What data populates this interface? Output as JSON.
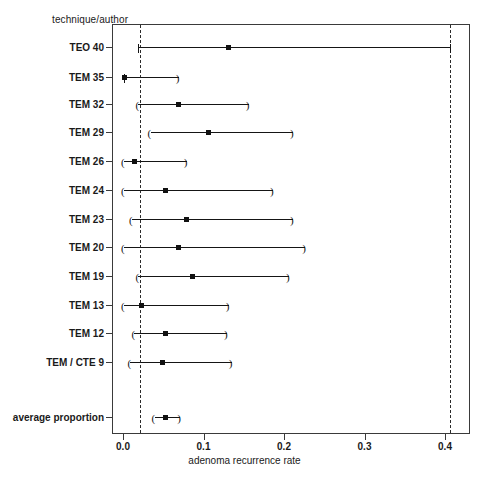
{
  "chart_data": {
    "type": "scatter",
    "title": "",
    "subtitle": "",
    "xlabel": "adenoma recurrence rate",
    "ylabel": "technique/author",
    "xlim": [
      -0.0137,
      0.431
    ],
    "xticks": [
      0.0,
      0.1,
      0.2,
      0.3,
      0.4
    ],
    "xticklabels": [
      "0.0",
      "0.1",
      "0.2",
      "0.3",
      "0.4"
    ],
    "grid": false,
    "legend": null,
    "orientation": "horizontal-forest-plot",
    "reference_lines": [
      {
        "name": "lower-reference",
        "x": 0.02,
        "style": "dashed"
      },
      {
        "name": "upper-reference",
        "x": 0.405,
        "style": "dashed"
      }
    ],
    "categories": [
      "TEO 40",
      "TEM 35",
      "TEM 32",
      "TEM 29",
      "TEM 26",
      "TEM 24",
      "TEM 23",
      "TEM 20",
      "TEM 19",
      "TEM 13",
      "TEM 12",
      "TEM / CTE 9",
      "average proportion"
    ],
    "series": [
      {
        "name": "adenoma recurrence rate (proportion with 95% CI)",
        "points": [
          {
            "label": "TEO 40",
            "estimate": 0.13,
            "ci_low": 0.018,
            "ci_high": 0.405,
            "y_px": 47,
            "cap_low": "|",
            "cap_high": "|"
          },
          {
            "label": "TEM 35",
            "estimate": 0.001,
            "ci_low": 0.0,
            "ci_high": 0.068,
            "y_px": 77,
            "cap_low": "|",
            "cap_high": ")"
          },
          {
            "label": "TEM 32",
            "estimate": 0.068,
            "ci_low": 0.018,
            "ci_high": 0.155,
            "y_px": 104,
            "cap_low": "(",
            "cap_high": ")"
          },
          {
            "label": "TEM 29",
            "estimate": 0.105,
            "ci_low": 0.033,
            "ci_high": 0.21,
            "y_px": 132,
            "cap_low": "(",
            "cap_high": ")"
          },
          {
            "label": "TEM 26",
            "estimate": 0.013,
            "ci_low": 0.0,
            "ci_high": 0.078,
            "y_px": 161,
            "cap_low": "(",
            "cap_high": ")"
          },
          {
            "label": "TEM 24",
            "estimate": 0.052,
            "ci_low": 0.0,
            "ci_high": 0.185,
            "y_px": 190,
            "cap_low": "(",
            "cap_high": ")"
          },
          {
            "label": "TEM 23",
            "estimate": 0.078,
            "ci_low": 0.01,
            "ci_high": 0.21,
            "y_px": 219,
            "cap_low": "(",
            "cap_high": ")"
          },
          {
            "label": "TEM 20",
            "estimate": 0.068,
            "ci_low": 0.0,
            "ci_high": 0.225,
            "y_px": 247,
            "cap_low": "(",
            "cap_high": ")"
          },
          {
            "label": "TEM 19",
            "estimate": 0.085,
            "ci_low": 0.018,
            "ci_high": 0.205,
            "y_px": 276,
            "cap_low": "(",
            "cap_high": ")"
          },
          {
            "label": "TEM 13",
            "estimate": 0.022,
            "ci_low": 0.0,
            "ci_high": 0.13,
            "y_px": 305,
            "cap_low": "(",
            "cap_high": ")"
          },
          {
            "label": "TEM 12",
            "estimate": 0.051,
            "ci_low": 0.013,
            "ci_high": 0.128,
            "y_px": 333,
            "cap_low": "(",
            "cap_high": ")"
          },
          {
            "label": "TEM / CTE 9",
            "estimate": 0.048,
            "ci_low": 0.008,
            "ci_high": 0.134,
            "y_px": 362,
            "cap_low": "(",
            "cap_high": ")"
          },
          {
            "label": "average proportion",
            "estimate": 0.052,
            "ci_low": 0.038,
            "ci_high": 0.07,
            "y_px": 417,
            "cap_low": "(",
            "cap_high": ")"
          }
        ]
      }
    ]
  },
  "axes": {
    "y_caption": "technique/author",
    "x_title": "adenoma recurrence rate"
  },
  "colors": {
    "frame": "#3a3a3a",
    "marker": "#111111",
    "line": "#151515",
    "reference": "#2b2b2b",
    "background": "#ffffff"
  }
}
